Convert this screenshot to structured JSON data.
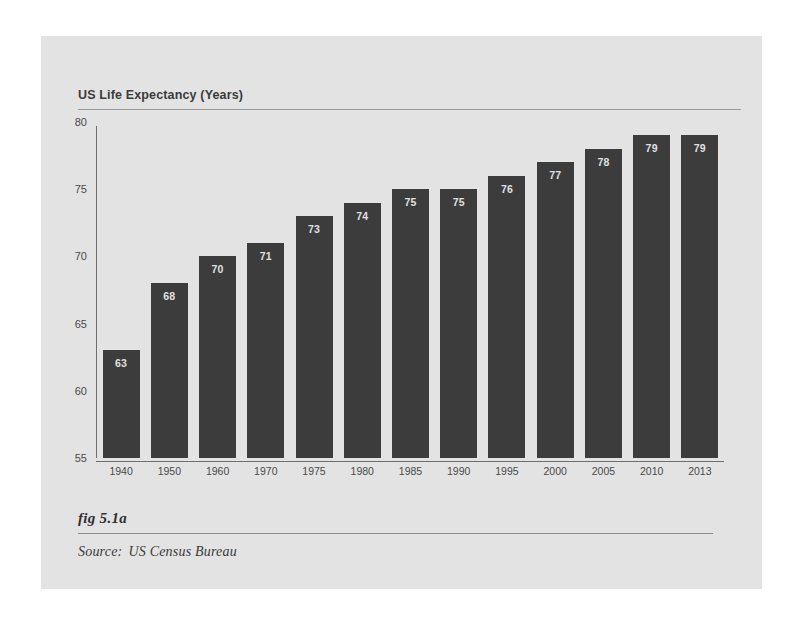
{
  "figure": {
    "panel_background": "#e3e3e3",
    "page_background": "#ffffff",
    "fig_label": "fig 5.1a",
    "source_label": "Source:",
    "source_text": "US Census Bureau"
  },
  "chart_data": {
    "type": "bar",
    "title": "US Life Expectancy (Years)",
    "xlabel": "",
    "ylabel": "",
    "categories": [
      "1940",
      "1950",
      "1960",
      "1970",
      "1975",
      "1980",
      "1985",
      "1990",
      "1995",
      "2000",
      "2005",
      "2010",
      "2013"
    ],
    "values": [
      63,
      68,
      70,
      71,
      73,
      74,
      75,
      75,
      76,
      77,
      78,
      79,
      79
    ],
    "value_labels": [
      "63",
      "68",
      "70",
      "71",
      "73",
      "74",
      "75",
      "75",
      "76",
      "77",
      "78",
      "79",
      "79"
    ],
    "ylim": [
      55,
      80
    ],
    "yticks": [
      80,
      75,
      70,
      65,
      60,
      55
    ],
    "ytick_labels": [
      "80",
      "75",
      "70",
      "65",
      "60",
      "55"
    ],
    "grid": false,
    "legend": null,
    "bar_color": "#3c3c3c",
    "value_label_color": "#e0e0e0",
    "axis_color": "#6e6e6e"
  }
}
